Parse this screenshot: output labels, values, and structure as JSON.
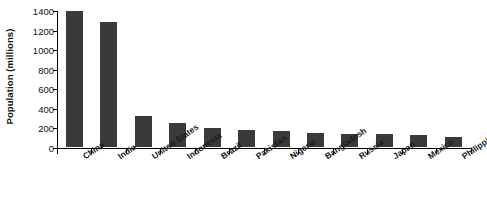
{
  "chart_data": {
    "type": "bar",
    "title": "",
    "xlabel": "",
    "ylabel": "Population (millions)",
    "ylim": [
      0,
      1400
    ],
    "yticks": [
      0,
      200,
      400,
      600,
      800,
      1000,
      1200,
      1400
    ],
    "ytick_labels": [
      "0",
      "200",
      "400",
      "600",
      "800",
      "1000",
      "1200",
      "1400"
    ],
    "grid": false,
    "legend": "none",
    "bar_color": "#3a3a3a",
    "axis_color": "#000000",
    "background_color": "#ffffff",
    "categories": [
      "China",
      "India",
      "United States",
      "Indonesia",
      "Brazil",
      "Pakistan",
      "Nigeria",
      "Bangladesh",
      "Russia",
      "Japan",
      "Mexico",
      "Philippines"
    ],
    "values": [
      1385,
      1280,
      320,
      245,
      195,
      178,
      165,
      148,
      135,
      128,
      120,
      100
    ]
  }
}
